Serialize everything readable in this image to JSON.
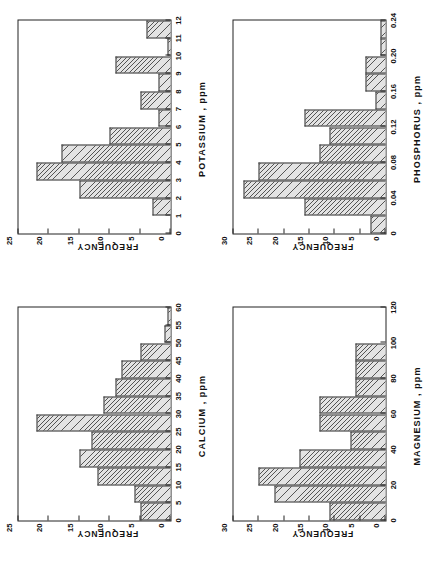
{
  "figure": {
    "panel_count": 4,
    "background": "#ffffff",
    "orientation": "page rotated 90 degrees counter-clockwise"
  },
  "chart_data": [
    {
      "type": "bar",
      "id": "potassium",
      "title": "",
      "xlabel": "POTASSIUM , ppm",
      "ylabel": "FREQUENCY",
      "xlim": [
        0,
        12
      ],
      "ylim": [
        0,
        25
      ],
      "xticks": [
        0,
        1,
        2,
        3,
        4,
        5,
        6,
        7,
        8,
        9,
        10,
        11,
        12
      ],
      "xticklabels": [
        "0",
        "1",
        "2",
        "3",
        "4",
        "5",
        "6",
        "7",
        "8",
        "9",
        "10",
        "11",
        "12"
      ],
      "yticks": [
        0,
        5,
        10,
        15,
        20,
        25
      ],
      "yticklabels": [
        "0",
        "5",
        "10",
        "15",
        "20",
        "25"
      ],
      "grid": false,
      "legend": "none",
      "bin_edges": [
        0,
        1,
        2,
        3,
        4,
        5,
        6,
        7,
        8,
        9,
        10,
        11,
        12
      ],
      "bins": [
        "0-1",
        "1-2",
        "2-3",
        "3-4",
        "4-5",
        "5-6",
        "6-7",
        "7-8",
        "8-9",
        "9-10",
        "10-11",
        "11-12"
      ],
      "values": [
        0,
        3,
        15,
        22,
        18,
        10,
        2,
        5,
        2,
        9,
        0.5,
        4
      ]
    },
    {
      "type": "bar",
      "id": "phosphorus",
      "title": "",
      "xlabel": "PHOSPHORUS , ppm",
      "ylabel": "FREQUENCY",
      "xlim": [
        0,
        0.24
      ],
      "ylim": [
        0,
        30
      ],
      "xticks": [
        0,
        0.04,
        0.08,
        0.12,
        0.16,
        0.2,
        0.24
      ],
      "xticklabels": [
        "0",
        "0.04",
        "0.08",
        "0.12",
        "0.16",
        "0.20",
        "0.24"
      ],
      "yticks": [
        0,
        5,
        10,
        15,
        20,
        25,
        30
      ],
      "yticklabels": [
        "0",
        "5",
        "10",
        "15",
        "20",
        "25",
        "30"
      ],
      "grid": false,
      "legend": "none",
      "bin_edges": [
        0,
        0.02,
        0.04,
        0.06,
        0.08,
        0.1,
        0.12,
        0.14,
        0.16,
        0.18,
        0.2,
        0.22,
        0.24
      ],
      "bins": [
        "0-0.02",
        "0.02-0.04",
        "0.04-0.06",
        "0.06-0.08",
        "0.08-0.10",
        "0.10-0.12",
        "0.12-0.14",
        "0.14-0.16",
        "0.16-0.18",
        "0.18-0.20",
        "0.20-0.22",
        "0.22-0.24"
      ],
      "values": [
        3,
        16,
        28,
        25,
        13,
        11,
        16,
        2,
        4,
        4,
        1,
        1
      ]
    },
    {
      "type": "bar",
      "id": "calcium",
      "title": "",
      "xlabel": "CALCIUM , ppm",
      "ylabel": "FREQUENCY",
      "xlim": [
        0,
        60
      ],
      "ylim": [
        0,
        25
      ],
      "xticks": [
        0,
        5,
        10,
        15,
        20,
        25,
        30,
        35,
        40,
        45,
        50,
        55,
        60
      ],
      "xticklabels": [
        "0",
        "5",
        "10",
        "15",
        "20",
        "25",
        "30",
        "35",
        "40",
        "45",
        "50",
        "55",
        "60"
      ],
      "yticks": [
        0,
        5,
        10,
        15,
        20,
        25
      ],
      "yticklabels": [
        "0",
        "5",
        "10",
        "15",
        "20",
        "25"
      ],
      "grid": false,
      "legend": "none",
      "bin_edges": [
        0,
        5,
        10,
        15,
        20,
        25,
        30,
        35,
        40,
        45,
        50,
        55,
        60
      ],
      "bins": [
        "0-5",
        "5-10",
        "10-15",
        "15-20",
        "20-25",
        "25-30",
        "30-35",
        "35-40",
        "40-45",
        "45-50",
        "50-55",
        "55-60"
      ],
      "values": [
        5,
        6,
        12,
        15,
        13,
        22,
        11,
        9,
        8,
        5,
        1,
        0.5
      ]
    },
    {
      "type": "bar",
      "id": "magnesium",
      "title": "",
      "xlabel": "MAGNESIUM , ppm",
      "ylabel": "FREQUENCY",
      "xlim": [
        0,
        120
      ],
      "ylim": [
        0,
        30
      ],
      "xticks": [
        0,
        20,
        40,
        60,
        80,
        100,
        120
      ],
      "xticklabels": [
        "0",
        "20",
        "40",
        "60",
        "80",
        "100",
        "120"
      ],
      "yticks": [
        0,
        5,
        10,
        15,
        20,
        25,
        30
      ],
      "yticklabels": [
        "0",
        "5",
        "10",
        "15",
        "20",
        "25",
        "30"
      ],
      "grid": false,
      "legend": "none",
      "bin_edges": [
        0,
        10,
        20,
        30,
        40,
        50,
        60,
        70,
        80,
        90,
        100,
        110,
        120
      ],
      "bins": [
        "0-10",
        "10-20",
        "20-30",
        "30-40",
        "40-50",
        "50-60",
        "60-70",
        "70-80",
        "80-90",
        "90-100",
        "100-110",
        "110-120"
      ],
      "values": [
        11,
        22,
        25,
        17,
        7,
        13,
        13,
        6,
        6,
        6,
        0,
        0
      ]
    }
  ]
}
